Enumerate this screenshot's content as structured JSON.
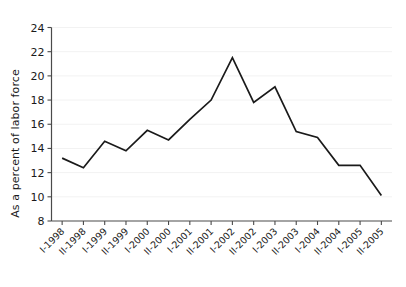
{
  "chart_data": {
    "type": "line",
    "title": "",
    "xlabel": "",
    "ylabel": "As a percent of labor force",
    "categories": [
      "I-1998",
      "II-1998",
      "I-1999",
      "II-1999",
      "I-2000",
      "II-2000",
      "I-2001",
      "II-2001",
      "I-2002",
      "II-2002",
      "I-2003",
      "II-2003",
      "I-2004",
      "II-2004",
      "I-2005",
      "II-2005"
    ],
    "values": [
      13.2,
      12.4,
      14.6,
      13.8,
      15.5,
      14.7,
      16.4,
      18.0,
      21.5,
      17.8,
      19.1,
      15.4,
      14.9,
      12.6,
      12.6,
      10.1
    ],
    "series": [
      {
        "name": "Unemployment",
        "values": [
          13.2,
          12.4,
          14.6,
          13.8,
          15.5,
          14.7,
          16.4,
          18.0,
          21.5,
          17.8,
          19.1,
          15.4,
          14.9,
          12.6,
          12.6,
          10.1
        ]
      }
    ],
    "ylim": [
      8,
      24
    ],
    "yticks": [
      8,
      10,
      12,
      14,
      16,
      18,
      20,
      22,
      24
    ],
    "ytick_labels": [
      "8",
      "10",
      "12",
      "14",
      "16",
      "18",
      "20",
      "22",
      "24"
    ],
    "grid": true,
    "grid_axis": "y",
    "legend": false,
    "line_color": "#1a1a1a",
    "grid_color": "#f2f2f2",
    "axis_color": "#4a4a4a",
    "background_color": "#ffffff"
  }
}
